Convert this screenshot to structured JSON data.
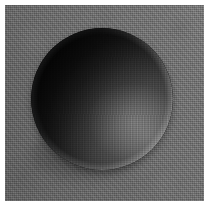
{
  "image": {
    "kind": "photograph",
    "subject": "sphere",
    "description": "Grayscale photograph of a dark matte sphere resting against a flat, grainy mid-gray backdrop.",
    "canvas": {
      "width_px": 209,
      "height_px": 206,
      "margin_color": "#ffffff",
      "margin_px": 5
    },
    "background": {
      "name": "gray-backdrop",
      "base_color": "#6e6e6e",
      "texture": "fine film grain with faint vertical and horizontal weave",
      "tone_note": "slightly lighter toward the right edge, slightly darker at the lower-left corner"
    },
    "sphere": {
      "name": "dark-sphere",
      "center_x_px": 102,
      "center_y_px": 99,
      "radius_px": 71,
      "base_color": "#2b2b2b",
      "shadow_color": "#0b0b0b",
      "lit_color": "#6a6a6a",
      "rim_color": "#b4b4b4",
      "light_direction": "lower-right",
      "terminator_note": "deep shadow occupies the upper-left lobe; brightest area sits low and right of center",
      "rim_light_note": "thin bright highlight traces the bottom-right contour",
      "bounce_light_note": "faint cool bounce along the far left limb"
    },
    "contact_shadow": {
      "name": "cast-shadow",
      "color": "rgba(0,0,0,0.30)",
      "position": "pooled beneath the lower-left of the sphere"
    },
    "palette": {
      "white": "#ffffff",
      "backdrop_gray": "#6e6e6e",
      "midtone_gray": "#4b4b4b",
      "shadow_black": "#0b0b0b",
      "highlight_gray": "#6a6a6a"
    }
  }
}
